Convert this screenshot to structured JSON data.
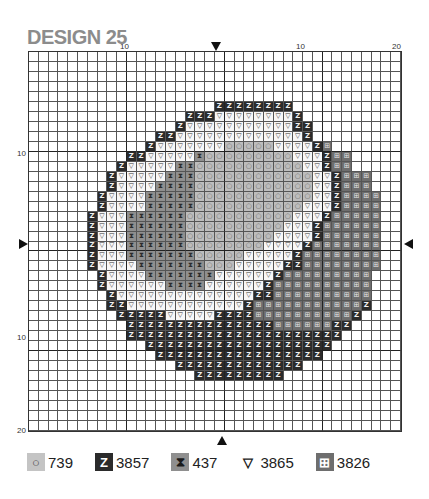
{
  "title": "DESIGN 25",
  "ticks": {
    "top": [
      {
        "label": "10",
        "x": 120
      },
      {
        "label": "10",
        "x": 296
      },
      {
        "label": "20",
        "x": 392
      }
    ],
    "left": [
      {
        "label": "10",
        "y": 149
      },
      {
        "label": "10",
        "y": 333
      },
      {
        "label": "20",
        "y": 426
      }
    ]
  },
  "legend": [
    {
      "code": "O",
      "symbol": "○",
      "label": "739",
      "bg": "#c4c4c4",
      "fg": "#444"
    },
    {
      "code": "Z",
      "symbol": "Z",
      "label": "3857",
      "bg": "#2b2b2b",
      "fg": "#ffffff"
    },
    {
      "code": "X",
      "symbol": "⧗",
      "label": "437",
      "bg": "#8f8f8f",
      "fg": "#1a1a1a"
    },
    {
      "code": "V",
      "symbol": "▽",
      "label": "3865",
      "bg": "transparent",
      "fg": "#222"
    },
    {
      "code": "D",
      "symbol": "⊞",
      "label": "3826",
      "bg": "#6e6e6e",
      "fg": "#ffffff"
    }
  ],
  "symbols": {
    "O": "○",
    "Z": "Z",
    "X": "⧗",
    "V": "▽",
    "D": "⊞"
  },
  "chart_data": {
    "type": "table",
    "title": "DESIGN 25",
    "grid": {
      "columns": 38,
      "rows": 38
    },
    "pattern_rows": [
      "......................................",
      "......................................",
      "......................................",
      "......................................",
      "......................................",
      "...................ZZZZZZZZ...........",
      "................ZZZVVVVVVVVZ..........",
      "...............ZVVVVVVVVVVVZZ.........",
      ".............ZZVVVVVVVVVVVVVZ.........",
      "............ZVVVVVVVOOOOOVVVVZD.......",
      "..........ZZVVVVVXOOOOOOOOOVVVZDD.....",
      ".........ZVVVVVXXOOOOOOOOOOOVVZDD.....",
      "........ZVVVVVXXXOOOOOOOOOOOOVVZDDD...",
      "........ZVVVVXXXXOOOOOOOOOOOOVVZDDD...",
      ".......ZVVVVXXXXXOOOOOOOOOOOOVVZDDDD..",
      ".......ZVVVVXXXXXOOOOOOOOOOOVVVZDDDD..",
      "......ZVVVXXXXXXOOOOOOOOOOOVVVZDDDDD..",
      "......ZVVVXXXXXXOOOOOOOOOOVVVZDDDDDD..",
      "......ZVVVXXXXXXOOOOOOOOOVVVVZDDDDDD..",
      "......ZVVVXXXXXXOOOOOOOOVVVVZDDDDDDD..",
      "......ZVVVXXXXXXXOOOOOVVVVVZDDDDDDDD..",
      "......ZVVVVXXXXXXXOOOVVVVVZZDDDDDDDD..",
      ".......ZVVVVXXXXXXXVVVVVVZDDDDDDDDD...",
      ".......ZVVVVVVXXXXVVVVVVZDDDDDDDDDD...",
      "........ZVVVVVVVVVVVVVVZZDDDDDDDDDD...",
      "........ZZVVVVVVVVVVVVZDDDDDDDDDDDZ...",
      ".........ZZZZZVVVVVZZZZDDDDDDDDDDZ....",
      "..........ZZZZZZZZZZZZZZZDDDDDDZZ.....",
      "..........ZZZZZZZZZZZZZZZZZZZZZZ......",
      "............ZZZZZZZZZZZZZZZZZZZ.......",
      ".............ZZZZZZZZZZZZZZZZZ........",
      "...............ZZZZZZZZZZZZZ..........",
      ".................ZZZZZZZZZ............",
      "......................................",
      "......................................",
      "......................................",
      "......................................",
      "......................................"
    ],
    "legend_entries": [
      {
        "symbol": "circle",
        "code": "739"
      },
      {
        "symbol": "Z",
        "code": "3857"
      },
      {
        "symbol": "hourglass",
        "code": "437"
      },
      {
        "symbol": "triangle-down",
        "code": "3865"
      },
      {
        "symbol": "boxed-arrow",
        "code": "3826"
      }
    ],
    "center_markers": [
      "top",
      "bottom",
      "left",
      "right"
    ]
  }
}
